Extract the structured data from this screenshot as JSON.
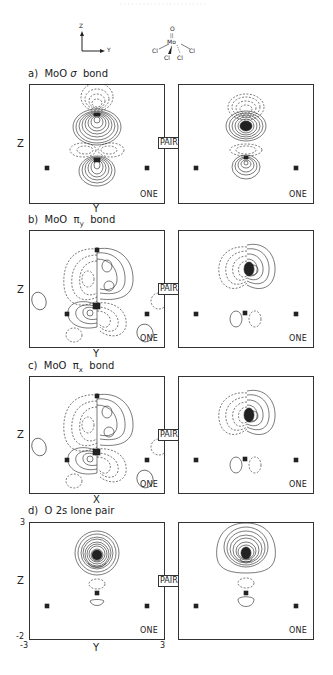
{
  "header": {
    "faint_running_text": "· · · · · · · · · · · · · · · · · · · · · · ·"
  },
  "axes_legend": {
    "z_label": "Z",
    "y_label": "Y"
  },
  "molecule": {
    "top": "O",
    "double_bond": "||",
    "center": "Mo",
    "ligands": [
      "Cl",
      "Cl",
      "Cl",
      "Cl"
    ]
  },
  "panels": [
    {
      "id": "a",
      "title_prefix": "a)",
      "title_main": "MoO",
      "title_greek": "σ",
      "title_sub": "",
      "title_suffix": "bond",
      "ylabel": "Z",
      "xlabel": "Y",
      "left_tag": "ONE",
      "right_tag": "ONE",
      "pair_tag": "PAIR"
    },
    {
      "id": "b",
      "title_prefix": "b)",
      "title_main": "MoO",
      "title_greek": "π",
      "title_sub": "y",
      "title_suffix": "bond",
      "ylabel": "Z",
      "xlabel": "Y",
      "left_tag": "ONE",
      "right_tag": "ONE",
      "pair_tag": "PAIR"
    },
    {
      "id": "c",
      "title_prefix": "c)",
      "title_main": "MoO",
      "title_greek": "π",
      "title_sub": "x",
      "title_suffix": "bond",
      "ylabel": "Z",
      "xlabel": "X",
      "left_tag": "ONE",
      "right_tag": "ONE",
      "pair_tag": "PAIR"
    },
    {
      "id": "d",
      "title_prefix": "d)",
      "title_main": "O 2s lone pair",
      "title_greek": "",
      "title_sub": "",
      "title_suffix": "",
      "ylabel": "Z",
      "xlabel": "Y",
      "left_tag": "ONE",
      "right_tag": "ONE",
      "pair_tag": "PAIR",
      "ticks": {
        "y_top": "3",
        "y_bottom": "-2",
        "x_left": "-3",
        "x_right": "3"
      }
    }
  ],
  "colors": {
    "line": "#222222",
    "frame": "#333333",
    "background": "#ffffff"
  }
}
